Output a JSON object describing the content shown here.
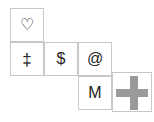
{
  "canvas": {
    "width": 154,
    "height": 122,
    "background": "#ffffff",
    "border_color": "#c8c8c8",
    "glyph_color": "#222222",
    "shape_color": "#9a9a9a"
  },
  "grid": {
    "cell_size": 34,
    "description": "staircase arrangement of bordered square tiles",
    "cells": [
      {
        "id": "cell-heart",
        "row": 1,
        "col": 1,
        "x": 10,
        "y": 8,
        "icon": "heart-outline-icon",
        "symbol": "♡"
      },
      {
        "id": "cell-dagger",
        "row": 2,
        "col": 1,
        "x": 10,
        "y": 42,
        "icon": "double-dagger-icon",
        "symbol": "‡"
      },
      {
        "id": "cell-dollar",
        "row": 2,
        "col": 2,
        "x": 44,
        "y": 42,
        "icon": "dollar-sign-icon",
        "symbol": "$"
      },
      {
        "id": "cell-at",
        "row": 2,
        "col": 3,
        "x": 78,
        "y": 42,
        "icon": "at-sign-icon",
        "symbol": "@"
      },
      {
        "id": "cell-m",
        "row": 3,
        "col": 3,
        "x": 78,
        "y": 76,
        "icon": "letter-m-icon",
        "symbol": "M"
      }
    ],
    "shape_cell": {
      "id": "cell-cross",
      "x": 112,
      "y": 72,
      "size": 40,
      "icon": "gray-cross-icon",
      "label": "cross"
    }
  }
}
